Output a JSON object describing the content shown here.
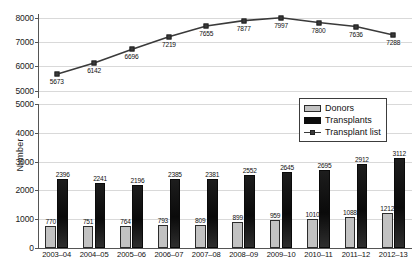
{
  "chart_data": {
    "type": "bar",
    "title": "",
    "xlabel": "",
    "ylabel": "Number",
    "categories": [
      "2003–04",
      "2004–05",
      "2005–06",
      "2006–07",
      "2007–08",
      "2008–09",
      "2009–10",
      "2010–11",
      "2011–12",
      "2012–13"
    ],
    "series": [
      {
        "name": "Donors",
        "type": "bar",
        "color": "#c2c2c2",
        "values": [
          770,
          751,
          764,
          793,
          809,
          899,
          959,
          1010,
          1088,
          1212
        ]
      },
      {
        "name": "Transplants",
        "type": "bar",
        "color": "#0d0d0d",
        "values": [
          2396,
          2241,
          2196,
          2385,
          2381,
          2552,
          2645,
          2695,
          2912,
          3112
        ]
      },
      {
        "name": "Transplant list",
        "type": "line",
        "color": "#3a3a3a",
        "values": [
          5673,
          6142,
          6696,
          7219,
          7655,
          7877,
          7997,
          7800,
          7636,
          7288
        ]
      }
    ],
    "axes": [
      {
        "panel": "top",
        "ylim": [
          4700,
          8150
        ],
        "ticks": [
          5000,
          6000,
          7000,
          8000
        ],
        "grid": true
      },
      {
        "panel": "bottom",
        "ylim": [
          0,
          5000
        ],
        "ticks": [
          0,
          1000,
          2000,
          3000,
          4000,
          5000
        ],
        "grid": true
      }
    ],
    "legend_position": "upper-right",
    "broken_axis": true
  },
  "legend": {
    "items": [
      {
        "label": "Donors",
        "swatch": "donors-swatch"
      },
      {
        "label": "Transplants",
        "swatch": "transplants-swatch"
      },
      {
        "label": "Transplant list",
        "swatch": "transplant-list-swatch"
      }
    ]
  }
}
